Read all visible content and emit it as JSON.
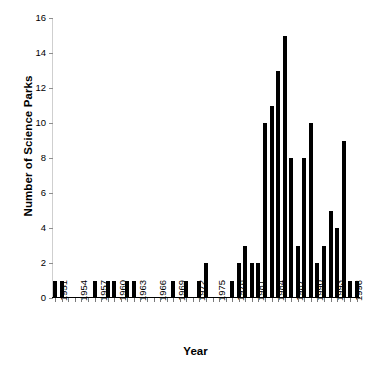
{
  "chart_data": {
    "type": "bar",
    "title": "",
    "xlabel": "Year",
    "ylabel": "Number of Science Parks",
    "ylim": [
      0,
      16
    ],
    "yticks": [
      0,
      2,
      4,
      6,
      8,
      10,
      12,
      14,
      16
    ],
    "xlim": [
      1951,
      1997
    ],
    "xtick_labels": [
      "1951",
      "1954",
      "1957",
      "1960",
      "1963",
      "1966",
      "1969",
      "1972",
      "1975",
      "1978",
      "1981",
      "1984",
      "1987",
      "1990",
      "1993",
      "1996"
    ],
    "xtick_step": 3,
    "grid": false,
    "legend": null,
    "bar_color": "#000000",
    "categories": [
      "1951",
      "1952",
      "1953",
      "1954",
      "1955",
      "1956",
      "1957",
      "1958",
      "1959",
      "1960",
      "1961",
      "1962",
      "1963",
      "1964",
      "1965",
      "1966",
      "1967",
      "1968",
      "1969",
      "1970",
      "1971",
      "1972",
      "1973",
      "1974",
      "1975",
      "1976",
      "1977",
      "1978",
      "1979",
      "1980",
      "1981",
      "1982",
      "1983",
      "1984",
      "1985",
      "1986",
      "1987",
      "1988",
      "1989",
      "1990",
      "1991",
      "1992",
      "1993",
      "1994",
      "1995",
      "1996",
      "1997"
    ],
    "values": [
      1,
      1,
      0,
      0,
      0,
      0,
      1,
      0,
      1,
      1,
      0,
      1,
      1,
      0,
      0,
      0,
      0,
      0,
      1,
      0,
      1,
      0,
      1,
      2,
      0,
      0,
      0,
      1,
      2,
      3,
      2,
      2,
      10,
      11,
      13,
      15,
      8,
      3,
      8,
      10,
      2,
      3,
      5,
      4,
      9,
      1,
      1
    ]
  },
  "axes": {
    "y_axis_title": "Number of Science Parks",
    "x_axis_title": "Year"
  }
}
